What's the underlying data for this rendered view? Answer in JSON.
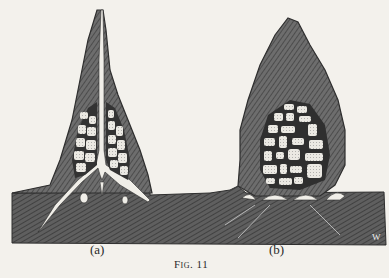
{
  "figure": {
    "caption": "Fig. 11",
    "panels": [
      {
        "label": "(a)",
        "description": "tall narrow termite mound with central channel and cell clusters"
      },
      {
        "label": "(b)",
        "description": "rounded conical termite mound with central dense cell nest"
      }
    ],
    "monogram": "W",
    "colors": {
      "background": "#f3f1ec",
      "ink": "#2e2e2e",
      "mound_fill": "#6d6d6d",
      "ground_fill": "#5e5e5e",
      "cells": "#e8e6e0"
    }
  }
}
